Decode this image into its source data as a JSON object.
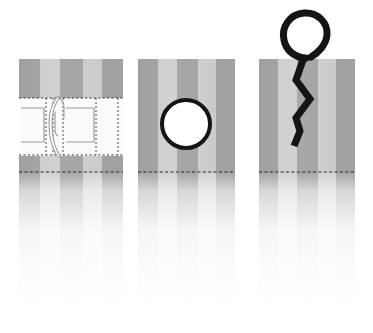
{
  "illustration": {
    "title": "Grommet installation sequence on striped fabric",
    "type": "technical-instruction-diagram",
    "background_color": "#ffffff",
    "panel_count": 3,
    "canvas": {
      "width": 373,
      "height": 333
    }
  },
  "palette": {
    "stripe_dark": "#a8a8a8",
    "stripe_light": "#d2d2d2",
    "stripe_dark_alt": "#b0b0b0",
    "ink_black": "#141414",
    "dash_line": "#2b2b2b",
    "fabric_white": "#fbfbfb",
    "outline_gray": "#8c8c8c",
    "fade_white": "#ffffff"
  },
  "stripes": {
    "pattern": [
      "dark",
      "light",
      "dark",
      "light",
      "dark"
    ],
    "note": "Vertical alternating gray bands running full height of each fabric panel"
  },
  "panels": [
    {
      "id": "panel-1",
      "step_number": "1",
      "label": "Marked fabric with stitch guide band",
      "x": 19,
      "y": 59,
      "width": 104,
      "height": 114,
      "features": [
        {
          "name": "horizontal-white-band",
          "y": 97,
          "height": 62
        },
        {
          "name": "dashed-stitch-line-top",
          "y": 98
        },
        {
          "name": "dashed-stitch-line-bottom",
          "y": 155
        },
        {
          "name": "dashed-stitch-line-hem",
          "y": 172
        },
        {
          "name": "left-rectangle-outline"
        },
        {
          "name": "right-rectangle-outline"
        },
        {
          "name": "center-hook-marking"
        }
      ]
    },
    {
      "id": "panel-2",
      "step_number": "2",
      "label": "Fabric with punched round eyelet hole",
      "x": 138,
      "y": 59,
      "width": 97,
      "height": 114,
      "features": [
        {
          "name": "eyelet-ring",
          "cx": 186,
          "cy": 124,
          "r": 25,
          "stroke_width": 4
        },
        {
          "name": "dashed-stitch-line-hem",
          "y": 172
        }
      ]
    },
    {
      "id": "panel-3",
      "step_number": "3",
      "label": "Fabric with S-hook and split ring inserted",
      "x": 259,
      "y": 59,
      "width": 96,
      "height": 114,
      "features": [
        {
          "name": "split-ring",
          "cx": 304,
          "cy": 31,
          "r": 21,
          "stroke_width": 7
        },
        {
          "name": "s-hook-wire",
          "stroke_width": 7
        },
        {
          "name": "dashed-stitch-line-hem",
          "y": 172
        }
      ]
    }
  ],
  "reflection": {
    "name": "fabric-fade-reflection",
    "description": "Soft vertical fade of the striped fabric continuing below each panel",
    "top": 173,
    "bottom": 300
  }
}
